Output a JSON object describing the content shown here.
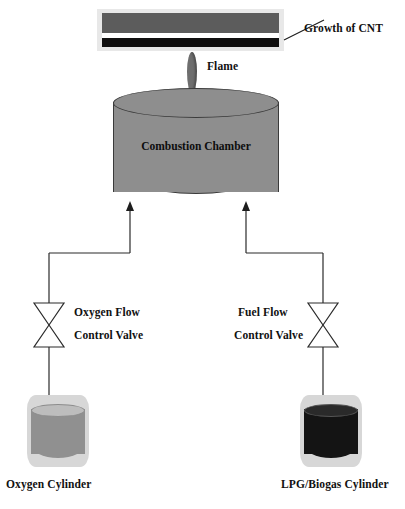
{
  "diagram": {
    "labels": {
      "growth_of_cnt": "Growth of CNT",
      "flame": "Flame",
      "combustion_chamber": "Combustion Chamber",
      "oxygen_valve_line1": "Oxygen Flow",
      "oxygen_valve_line2": "Control Valve",
      "fuel_valve_line1": "Fuel Flow",
      "fuel_valve_line2": "Control Valve",
      "oxygen_cylinder": "Oxygen Cylinder",
      "lpg_cylinder": "LPG/Biogas Cylinder"
    },
    "colors": {
      "substrate_frame": "#e8e8e8",
      "substrate_top_bar": "#5c5c5c",
      "cnt_layer": "#100f0f",
      "flame": "#6e6e6e",
      "chamber_fill": "#8e8e8e",
      "chamber_outline": "#3a3a3a",
      "oxygen_cylinder_fill": "#909090",
      "lpg_cylinder_fill": "#141414",
      "cylinder_rim": "#d7d7d7",
      "pipe_line": "#2b2b2b",
      "text": "#111111",
      "background": "#ffffff"
    },
    "icons": {
      "oxygen_valve": "bowtie-valve-icon",
      "fuel_valve": "bowtie-valve-icon",
      "oxygen_inlet_arrow": "arrow-up-icon",
      "fuel_inlet_arrow": "arrow-up-icon",
      "cnt_leader": "leader-line-icon"
    }
  }
}
